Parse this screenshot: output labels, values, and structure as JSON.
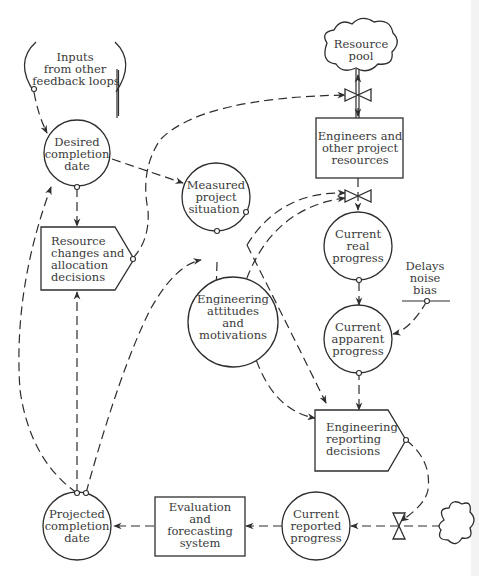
{
  "diagram": {
    "title": "",
    "colors": {
      "line": "#2e2e2e",
      "text": "#3a3a3a",
      "background": "#ffffff"
    },
    "nodes": {
      "inputs": {
        "type": "source-bracket",
        "lines": [
          "Inputs",
          "from other",
          "feedback loops"
        ]
      },
      "resource_pool": {
        "type": "cloud",
        "lines": [
          "Resource",
          "pool"
        ]
      },
      "desired_completion": {
        "type": "circle",
        "lines": [
          "Desired",
          "completion",
          "date"
        ]
      },
      "engineers_resources": {
        "type": "level-rect",
        "lines": [
          "Engineers and",
          "other project",
          "resources"
        ]
      },
      "measured_situation": {
        "type": "circle",
        "lines": [
          "Measured",
          "project",
          "situation"
        ]
      },
      "resource_decisions": {
        "type": "decision-pentagon",
        "lines": [
          "Resource",
          "changes and",
          "allocation",
          "decisions"
        ]
      },
      "current_real": {
        "type": "circle",
        "lines": [
          "Current",
          "real",
          "progress"
        ]
      },
      "delays": {
        "type": "parameter",
        "lines": [
          "Delays",
          "noise",
          "bias"
        ]
      },
      "eng_attitudes": {
        "type": "circle",
        "lines": [
          "Engineering",
          "attitudes",
          "and",
          "motivations"
        ]
      },
      "current_apparent": {
        "type": "circle",
        "lines": [
          "Current",
          "apparent",
          "progress"
        ]
      },
      "eng_reporting": {
        "type": "decision-pentagon",
        "lines": [
          "Engineering",
          "reporting",
          "decisions"
        ]
      },
      "projected_completion": {
        "type": "circle",
        "lines": [
          "Projected",
          "completion",
          "date"
        ]
      },
      "evaluation": {
        "type": "level-rect",
        "lines": [
          "Evaluation",
          "and",
          "forecasting",
          "system"
        ]
      },
      "current_reported": {
        "type": "circle",
        "lines": [
          "Current",
          "reported",
          "progress"
        ]
      },
      "source_cloud": {
        "type": "cloud",
        "lines": []
      }
    },
    "edges": [
      {
        "from": "inputs",
        "to": "desired_completion",
        "style": "dashed"
      },
      {
        "from": "desired_completion",
        "to": "measured_situation",
        "style": "dashed"
      },
      {
        "from": "desired_completion",
        "to": "resource_decisions",
        "style": "dashed"
      },
      {
        "from": "resource_decisions",
        "to": "resource_valve",
        "style": "dashed"
      },
      {
        "from": "resource_pool",
        "to": "engineers_resources",
        "style": "double-flow"
      },
      {
        "from": "engineers_resources",
        "to": "current_real",
        "style": "flow"
      },
      {
        "from": "measured_situation",
        "to": "progress_valve",
        "style": "dashed"
      },
      {
        "from": "eng_attitudes",
        "to": "progress_valve",
        "style": "dashed"
      },
      {
        "from": "measured_situation",
        "to": "eng_attitudes",
        "style": "dashed"
      },
      {
        "from": "measured_situation",
        "to": "eng_reporting",
        "style": "dashed"
      },
      {
        "from": "current_real",
        "to": "current_apparent",
        "style": "dashed"
      },
      {
        "from": "delays",
        "to": "current_apparent",
        "style": "dashed"
      },
      {
        "from": "current_apparent",
        "to": "eng_reporting",
        "style": "dashed"
      },
      {
        "from": "eng_attitudes",
        "to": "eng_reporting",
        "style": "dashed"
      },
      {
        "from": "eng_reporting",
        "to": "reporting_valve",
        "style": "dashed"
      },
      {
        "from": "source_cloud",
        "to": "current_reported",
        "style": "dashed"
      },
      {
        "from": "current_reported",
        "to": "evaluation",
        "style": "dashed"
      },
      {
        "from": "evaluation",
        "to": "projected_completion",
        "style": "dashed"
      },
      {
        "from": "projected_completion",
        "to": "desired_completion",
        "style": "dashed"
      },
      {
        "from": "projected_completion",
        "to": "resource_decisions",
        "style": "dashed"
      },
      {
        "from": "projected_completion",
        "to": "measured_situation",
        "style": "dashed"
      }
    ]
  }
}
